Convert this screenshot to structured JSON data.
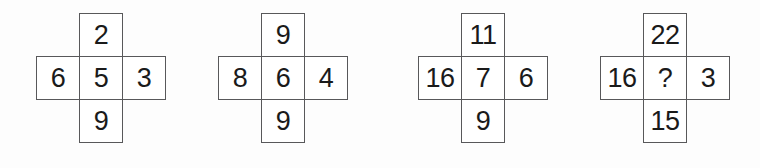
{
  "figure": {
    "shape": "plus-cross",
    "cell_count_per_cross": 5,
    "colors": {
      "background": "#fdfdfd",
      "cell_fill": "#ffffff",
      "border": "#58585a",
      "text": "#1a1a1a"
    }
  },
  "crosses": [
    {
      "name": "cross-1",
      "top": "2",
      "left": "6",
      "center": "5",
      "right": "3",
      "bottom": "9"
    },
    {
      "name": "cross-2",
      "top": "9",
      "left": "8",
      "center": "6",
      "right": "4",
      "bottom": "9"
    },
    {
      "name": "cross-3",
      "top": "11",
      "left": "16",
      "center": "7",
      "right": "6",
      "bottom": "9"
    },
    {
      "name": "cross-4",
      "top": "22",
      "left": "16",
      "center": "?",
      "right": "3",
      "bottom": "15"
    }
  ]
}
